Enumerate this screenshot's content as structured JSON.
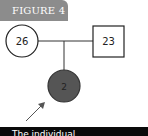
{
  "figure": {
    "label": "FIGURE 4"
  },
  "pedigree": {
    "mother": {
      "shape": "circle",
      "age": "26",
      "affected": false
    },
    "father": {
      "shape": "square",
      "age": "23",
      "affected": false
    },
    "child": {
      "shape": "circle",
      "age": "2",
      "affected": true,
      "proband": true
    }
  },
  "colors": {
    "tab": "#8c8c8c",
    "affected_fill": "#555555",
    "line": "#333333",
    "caption_bg": "#0a0a0a"
  },
  "caption": {
    "text": "The individual"
  }
}
